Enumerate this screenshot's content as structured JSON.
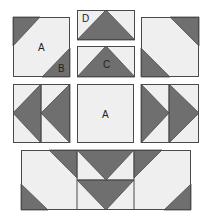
{
  "colors": {
    "dark": "#6f6f6f",
    "light": "#efefef",
    "stroke": "#4a4a4a",
    "background": "#ffffff"
  },
  "blocks": [
    {
      "name": "block-a-top-left",
      "rect": [
        13,
        17,
        57,
        60
      ],
      "darks": [
        [
          [
            13,
            17
          ],
          [
            40,
            17
          ],
          [
            13,
            46
          ]
        ],
        [
          [
            70,
            48
          ],
          [
            70,
            77
          ],
          [
            42,
            77
          ]
        ]
      ],
      "lines": [],
      "labels": [
        {
          "text": "A",
          "x": 38,
          "y": 51
        },
        {
          "text": "B",
          "x": 58,
          "y": 72
        }
      ]
    },
    {
      "name": "block-d",
      "rect": [
        77,
        10,
        58,
        30
      ],
      "darks": [
        [
          [
            77,
            40
          ],
          [
            106,
            10
          ],
          [
            135,
            40
          ]
        ]
      ],
      "lines": [],
      "labels": [
        {
          "text": "D",
          "x": 82,
          "y": 22
        }
      ]
    },
    {
      "name": "block-c",
      "rect": [
        77,
        46,
        58,
        31
      ],
      "darks": [
        [
          [
            77,
            77
          ],
          [
            106,
            46
          ],
          [
            135,
            77
          ]
        ]
      ],
      "lines": [],
      "labels": [
        {
          "text": "C",
          "x": 103,
          "y": 68
        }
      ]
    },
    {
      "name": "block-top-right",
      "rect": [
        141,
        17,
        58,
        60
      ],
      "darks": [
        [
          [
            170,
            17
          ],
          [
            199,
            17
          ],
          [
            199,
            46
          ]
        ],
        [
          [
            141,
            48
          ],
          [
            141,
            77
          ],
          [
            170,
            77
          ]
        ]
      ],
      "lines": [],
      "labels": []
    },
    {
      "name": "block-left-geese",
      "rect": [
        13,
        84,
        57,
        59
      ],
      "darks": [
        [
          [
            13,
            113
          ],
          [
            41,
            84
          ],
          [
            41,
            143
          ]
        ],
        [
          [
            41,
            113
          ],
          [
            70,
            84
          ],
          [
            70,
            143
          ]
        ]
      ],
      "lines": [
        [
          [
            41,
            84
          ],
          [
            41,
            143
          ]
        ]
      ],
      "labels": []
    },
    {
      "name": "block-center-a",
      "rect": [
        77,
        84,
        57,
        59
      ],
      "darks": [],
      "lines": [],
      "labels": [
        {
          "text": "A",
          "x": 102,
          "y": 118
        }
      ]
    },
    {
      "name": "block-right-geese",
      "rect": [
        141,
        84,
        58,
        59
      ],
      "darks": [
        [
          [
            141,
            84
          ],
          [
            169,
            113
          ],
          [
            141,
            143
          ]
        ],
        [
          [
            169,
            84
          ],
          [
            199,
            113
          ],
          [
            169,
            143
          ]
        ]
      ],
      "lines": [
        [
          [
            169,
            84
          ],
          [
            169,
            143
          ]
        ]
      ],
      "labels": []
    },
    {
      "name": "bottom-band",
      "rect": [
        21,
        150,
        170,
        60
      ],
      "darks": [
        [
          [
            21,
            184
          ],
          [
            21,
            210
          ],
          [
            48,
            210
          ]
        ],
        [
          [
            49,
            150
          ],
          [
            77,
            150
          ],
          [
            77,
            178
          ]
        ],
        [
          [
            77,
            150
          ],
          [
            134,
            150
          ],
          [
            106,
            180
          ]
        ],
        [
          [
            77,
            180
          ],
          [
            134,
            180
          ],
          [
            106,
            210
          ]
        ],
        [
          [
            134,
            150
          ],
          [
            162,
            150
          ],
          [
            134,
            178
          ]
        ],
        [
          [
            191,
            184
          ],
          [
            191,
            210
          ],
          [
            164,
            210
          ]
        ]
      ],
      "lines": [
        [
          [
            77,
            150
          ],
          [
            77,
            210
          ]
        ],
        [
          [
            134,
            150
          ],
          [
            134,
            210
          ]
        ],
        [
          [
            77,
            180
          ],
          [
            134,
            180
          ]
        ]
      ],
      "labels": []
    }
  ]
}
